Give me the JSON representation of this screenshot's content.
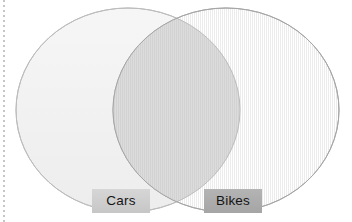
{
  "diagram": {
    "type": "venn",
    "title": "",
    "background_color": "#ffffff",
    "margin_rule": {
      "name": "dotted-margin-line",
      "style": "dotted",
      "color": "#9a9a9a",
      "orientation": "vertical",
      "x": 4
    },
    "sets": [
      {
        "id": "cars",
        "label": "Cars",
        "shape": "ellipse",
        "cx": 128,
        "cy": 110,
        "rx": 112,
        "ry": 102,
        "fill_color": "#f2f2f2",
        "stroke_color": "#b9b9b9",
        "label_chip": {
          "background_color": "#cfcfcf",
          "text_color": "#141414",
          "x": 92,
          "y": 189,
          "width": 58,
          "height": 24
        }
      },
      {
        "id": "bikes",
        "label": "Bikes",
        "shape": "ellipse",
        "cx": 226,
        "cy": 110,
        "rx": 113,
        "ry": 102,
        "fill_color": "#f0f0f0",
        "stroke_color": "#a8a8a8",
        "texture": "vertical-stripes",
        "label_chip": {
          "background_color": "#adadad",
          "text_color": "#141414",
          "x": 204,
          "y": 189,
          "width": 58,
          "height": 24
        }
      }
    ],
    "intersection": {
      "id": "cars-bikes-overlap",
      "label": "",
      "fill_color": "#d9d9d9",
      "x_range": [
        113,
        240
      ]
    }
  }
}
